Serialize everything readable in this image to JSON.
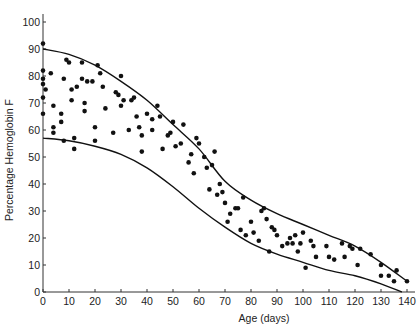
{
  "chart_data": {
    "type": "scatter",
    "title": "",
    "xlabel": "Age (days)",
    "ylabel": "Percentage Hemoglobin F",
    "xlim": [
      0,
      140
    ],
    "ylim": [
      0,
      100
    ],
    "x_ticks": [
      0,
      10,
      20,
      30,
      40,
      50,
      60,
      70,
      80,
      90,
      100,
      110,
      120,
      130,
      140
    ],
    "y_ticks": [
      0,
      10,
      20,
      30,
      40,
      50,
      60,
      70,
      80,
      90,
      100
    ],
    "grid": false,
    "legend": null,
    "series": [
      {
        "name": "Observations",
        "kind": "points",
        "points": [
          [
            0,
            92
          ],
          [
            0,
            82
          ],
          [
            0,
            79
          ],
          [
            0,
            77
          ],
          [
            0,
            72
          ],
          [
            0,
            66
          ],
          [
            1,
            75
          ],
          [
            3,
            81
          ],
          [
            4,
            69
          ],
          [
            4,
            61
          ],
          [
            4,
            59
          ],
          [
            7,
            66
          ],
          [
            7,
            63
          ],
          [
            8,
            56
          ],
          [
            8,
            79
          ],
          [
            9,
            86
          ],
          [
            10,
            85
          ],
          [
            11,
            75
          ],
          [
            11,
            71
          ],
          [
            12,
            53
          ],
          [
            12,
            57
          ],
          [
            13,
            76
          ],
          [
            15,
            79
          ],
          [
            15,
            85
          ],
          [
            16,
            70
          ],
          [
            16,
            67
          ],
          [
            17,
            78
          ],
          [
            19,
            78
          ],
          [
            20,
            61
          ],
          [
            20,
            56
          ],
          [
            21,
            84
          ],
          [
            22,
            81
          ],
          [
            23,
            76
          ],
          [
            24,
            68
          ],
          [
            27,
            59
          ],
          [
            28,
            74
          ],
          [
            29,
            73
          ],
          [
            30,
            69
          ],
          [
            30,
            80
          ],
          [
            31,
            71
          ],
          [
            33,
            60
          ],
          [
            34,
            71
          ],
          [
            35,
            72
          ],
          [
            36,
            65
          ],
          [
            37,
            61
          ],
          [
            38,
            58
          ],
          [
            38,
            52
          ],
          [
            40,
            66
          ],
          [
            42,
            64
          ],
          [
            42,
            60
          ],
          [
            44,
            69
          ],
          [
            45,
            65
          ],
          [
            46,
            53
          ],
          [
            48,
            58
          ],
          [
            49,
            59
          ],
          [
            50,
            63
          ],
          [
            51,
            54
          ],
          [
            53,
            55
          ],
          [
            54,
            62
          ],
          [
            56,
            48
          ],
          [
            57,
            51
          ],
          [
            58,
            44
          ],
          [
            59,
            57
          ],
          [
            60,
            55
          ],
          [
            62,
            50
          ],
          [
            63,
            46
          ],
          [
            64,
            38
          ],
          [
            65,
            47
          ],
          [
            66,
            52
          ],
          [
            67,
            36
          ],
          [
            68,
            40
          ],
          [
            69,
            37
          ],
          [
            70,
            33
          ],
          [
            71,
            26
          ],
          [
            72,
            29
          ],
          [
            74,
            31
          ],
          [
            75,
            31
          ],
          [
            76,
            23
          ],
          [
            77,
            35
          ],
          [
            78,
            21
          ],
          [
            80,
            26
          ],
          [
            81,
            22
          ],
          [
            83,
            19
          ],
          [
            84,
            30
          ],
          [
            85,
            31
          ],
          [
            86,
            27
          ],
          [
            87,
            15
          ],
          [
            88,
            24
          ],
          [
            89,
            23
          ],
          [
            90,
            21
          ],
          [
            92,
            17
          ],
          [
            94,
            18
          ],
          [
            95,
            20
          ],
          [
            96,
            18
          ],
          [
            97,
            21
          ],
          [
            98,
            15
          ],
          [
            99,
            18
          ],
          [
            100,
            22
          ],
          [
            101,
            9
          ],
          [
            103,
            19
          ],
          [
            104,
            17
          ],
          [
            105,
            13
          ],
          [
            109,
            17
          ],
          [
            110,
            13
          ],
          [
            112,
            12
          ],
          [
            115,
            18
          ],
          [
            116,
            13
          ],
          [
            118,
            17
          ],
          [
            119,
            16
          ],
          [
            121,
            10
          ],
          [
            122,
            16
          ],
          [
            126,
            14
          ],
          [
            130,
            10
          ],
          [
            130,
            6
          ],
          [
            133,
            6
          ],
          [
            135,
            4
          ],
          [
            136,
            8
          ],
          [
            140,
            4
          ]
        ]
      },
      {
        "name": "Upper envelope",
        "kind": "curve",
        "points": [
          [
            0,
            90
          ],
          [
            10,
            88
          ],
          [
            20,
            84
          ],
          [
            30,
            78
          ],
          [
            40,
            71
          ],
          [
            50,
            62
          ],
          [
            60,
            53
          ],
          [
            70,
            41
          ],
          [
            80,
            34
          ],
          [
            90,
            29
          ],
          [
            100,
            25
          ],
          [
            110,
            21
          ],
          [
            120,
            17
          ],
          [
            130,
            11
          ],
          [
            140,
            4
          ]
        ]
      },
      {
        "name": "Lower envelope",
        "kind": "curve",
        "points": [
          [
            0,
            57
          ],
          [
            10,
            56
          ],
          [
            20,
            54
          ],
          [
            30,
            51
          ],
          [
            40,
            46
          ],
          [
            50,
            39
          ],
          [
            60,
            31
          ],
          [
            70,
            24
          ],
          [
            80,
            18
          ],
          [
            90,
            14
          ],
          [
            100,
            11
          ],
          [
            110,
            8
          ],
          [
            120,
            6
          ],
          [
            130,
            3
          ],
          [
            138,
            0
          ]
        ]
      }
    ]
  }
}
